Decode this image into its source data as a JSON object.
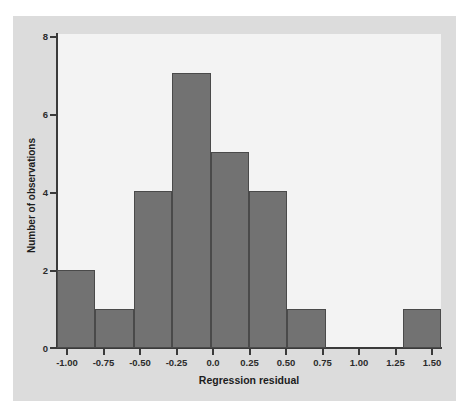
{
  "chart_data": {
    "type": "bar",
    "title": "",
    "subtitle": "",
    "xlabel": "Regression residual",
    "ylabel": "Number of observations",
    "xlim": [
      -1.0,
      1.5
    ],
    "ylim": [
      0,
      8
    ],
    "grid": false,
    "legend": null,
    "bin_width": 0.25,
    "bin_edges": [
      -1.0,
      -0.75,
      -0.5,
      -0.25,
      0.0,
      0.25,
      0.5,
      0.75,
      1.0,
      1.25,
      1.5
    ],
    "categories": [
      "-1.00 to -0.75",
      "-0.75 to -0.50",
      "-0.50 to -0.25",
      "-0.25 to 0.00",
      "0.00 to 0.25",
      "0.25 to 0.50",
      "0.50 to 0.75",
      "0.75 to 1.00",
      "1.00 to 1.25",
      "1.25 to 1.50"
    ],
    "values": [
      2,
      1,
      4,
      7,
      5,
      4,
      1,
      0,
      0,
      1
    ],
    "xticks": [
      "-1.00",
      "-0.75",
      "-0.50",
      "-0.25",
      "0.0",
      "0.25",
      "0.50",
      "0.75",
      "1.00",
      "1.25",
      "1.50"
    ],
    "xtick_values": [
      -1.0,
      -0.75,
      -0.5,
      -0.25,
      0.0,
      0.25,
      0.5,
      0.75,
      1.0,
      1.25,
      1.5
    ],
    "yticks": [
      "0",
      "2",
      "4",
      "6",
      "8"
    ],
    "ytick_values": [
      0,
      2,
      4,
      6,
      8
    ],
    "total_observations": 25,
    "colors": {
      "bar_fill": "#727272",
      "bar_edge": "#4a4a4a",
      "axis": "#3a3a3a",
      "plot_background": "#f3f3f3",
      "panel_background": "#dcdcdc",
      "figure_background": "#ffffff",
      "text": "#1d1d1d"
    }
  }
}
